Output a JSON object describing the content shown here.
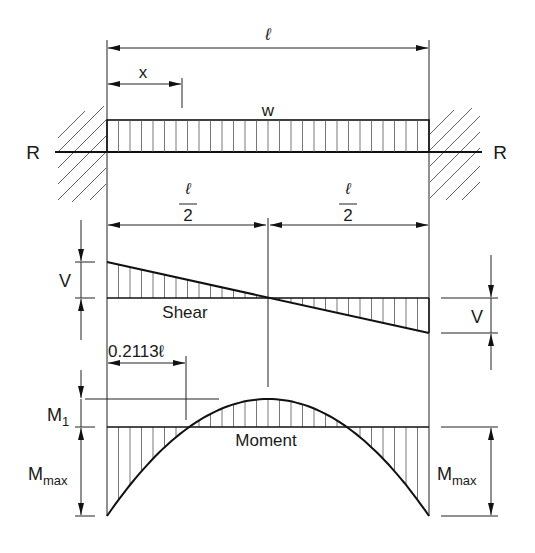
{
  "figure": {
    "type": "fixed-fixed beam, uniformly distributed load",
    "colors": {
      "line": "#1a1a1a",
      "background": "#ffffff",
      "hatch": "#555555"
    }
  },
  "labels": {
    "span": "ℓ",
    "x_distance": "x",
    "load": "w",
    "reaction_left": "R",
    "reaction_right": "R",
    "half_span_num": "ℓ",
    "half_span_den": "2",
    "shear_value_left": "V",
    "shear_value_right": "V",
    "shear_title": "Shear",
    "inflection_distance": "0.2113ℓ",
    "m1_main": "M",
    "m1_sub": "1",
    "mmax_main": "M",
    "mmax_sub": "max",
    "moment_title": "Moment"
  }
}
